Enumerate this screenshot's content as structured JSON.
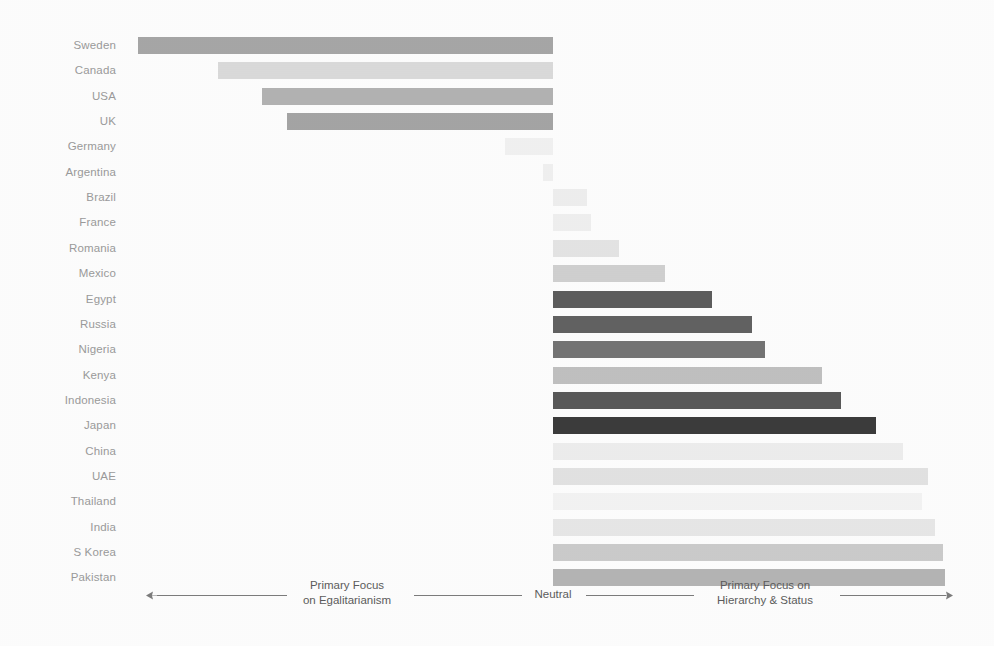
{
  "chart_data": {
    "type": "bar",
    "orientation": "horizontal",
    "variant": "diverging-scale",
    "title": "",
    "subtitle": "",
    "xlabel": "",
    "ylabel": "",
    "grid": false,
    "legend": null,
    "axis_scale": {
      "left_label": "Primary Focus\non Egalitarianism",
      "left_label_line1": "Primary Focus",
      "left_label_line2": "on Egalitarianism",
      "center_label": "Neutral",
      "right_label_line1": "Primary Focus on",
      "right_label_line2": "Hierarchy & Status",
      "neutral_position_px": 553,
      "axis_min_px": 138,
      "axis_max_px": 950
    },
    "categories": [
      "Sweden",
      "Canada",
      "USA",
      "UK",
      "Germany",
      "Argentina",
      "Brazil",
      "France",
      "Romania",
      "Mexico",
      "Egypt",
      "Russia",
      "Nigeria",
      "Kenya",
      "Indonesia",
      "Japan",
      "China",
      "UAE",
      "Thailand",
      "India",
      "S Korea",
      "Pakistan"
    ],
    "values_px_from_neutral": [
      -415,
      -335,
      -291,
      -266,
      -48,
      -10,
      34,
      38,
      66,
      112,
      159,
      199,
      212,
      269,
      288,
      323,
      350,
      375,
      369,
      382,
      390,
      392
    ],
    "values_normalized": [
      -1.0,
      -0.81,
      -0.7,
      -0.64,
      -0.12,
      -0.02,
      0.09,
      0.1,
      0.17,
      0.28,
      0.4,
      0.5,
      0.53,
      0.68,
      0.73,
      0.81,
      0.88,
      0.94,
      0.93,
      0.96,
      0.98,
      0.99
    ],
    "bars": [
      {
        "label": "Sweden",
        "x1": 138,
        "x2": 553,
        "color": "#a8a8a8",
        "side": "left"
      },
      {
        "label": "Canada",
        "x1": 218,
        "x2": 553,
        "color": "#dcdcdc",
        "side": "left"
      },
      {
        "label": "USA",
        "x1": 262,
        "x2": 553,
        "color": "#b4b4b4",
        "side": "left"
      },
      {
        "label": "UK",
        "x1": 287,
        "x2": 553,
        "color": "#a6a6a6",
        "side": "left"
      },
      {
        "label": "Germany",
        "x1": 505,
        "x2": 553,
        "color": "#f3f3f3",
        "side": "left"
      },
      {
        "label": "Argentina",
        "x1": 543,
        "x2": 553,
        "color": "#f2f2f2",
        "side": "left"
      },
      {
        "label": "Brazil",
        "x1": 553,
        "x2": 587,
        "color": "#f0f0f0",
        "side": "right"
      },
      {
        "label": "France",
        "x1": 553,
        "x2": 591,
        "color": "#f1f1f1",
        "side": "right"
      },
      {
        "label": "Romania",
        "x1": 553,
        "x2": 619,
        "color": "#e6e6e6",
        "side": "right"
      },
      {
        "label": "Mexico",
        "x1": 553,
        "x2": 665,
        "color": "#d2d2d2",
        "side": "right"
      },
      {
        "label": "Egypt",
        "x1": 553,
        "x2": 712,
        "color": "#5e5e5e",
        "side": "right"
      },
      {
        "label": "Russia",
        "x1": 553,
        "x2": 752,
        "color": "#636363",
        "side": "right"
      },
      {
        "label": "Nigeria",
        "x1": 553,
        "x2": 765,
        "color": "#757575",
        "side": "right"
      },
      {
        "label": "Kenya",
        "x1": 553,
        "x2": 822,
        "color": "#c2c2c2",
        "side": "right"
      },
      {
        "label": "Indonesia",
        "x1": 553,
        "x2": 841,
        "color": "#5a5a5a",
        "side": "right"
      },
      {
        "label": "Japan",
        "x1": 553,
        "x2": 876,
        "color": "#3c3c3c",
        "side": "right"
      },
      {
        "label": "China",
        "x1": 553,
        "x2": 903,
        "color": "#efefef",
        "side": "right"
      },
      {
        "label": "UAE",
        "x1": 553,
        "x2": 928,
        "color": "#e4e4e4",
        "side": "right"
      },
      {
        "label": "Thailand",
        "x1": 553,
        "x2": 922,
        "color": "#f5f5f5",
        "side": "right"
      },
      {
        "label": "India",
        "x1": 553,
        "x2": 935,
        "color": "#e9e9e9",
        "side": "right"
      },
      {
        "label": "S Korea",
        "x1": 553,
        "x2": 943,
        "color": "#cdcdcd",
        "side": "right"
      },
      {
        "label": "Pakistan",
        "x1": 553,
        "x2": 945,
        "color": "#b6b6b6",
        "side": "right"
      }
    ],
    "geometry": {
      "first_row_top": 37,
      "row_pitch": 25.35,
      "bar_height": 17
    }
  },
  "axis": {
    "left_arrow_icon": "arrow-left-icon",
    "right_arrow_icon": "arrow-right-icon",
    "left_text_line1": "Primary Focus",
    "left_text_line2": "on Egalitarianism",
    "center_text": "Neutral",
    "right_text_line1": "Primary Focus on",
    "right_text_line2": "Hierarchy & Status"
  },
  "colors": {
    "background": "#ffffff",
    "label_text": "#9c9c9c",
    "axis_text": "#5d5d5d",
    "axis_line": "#7d7d7d"
  }
}
